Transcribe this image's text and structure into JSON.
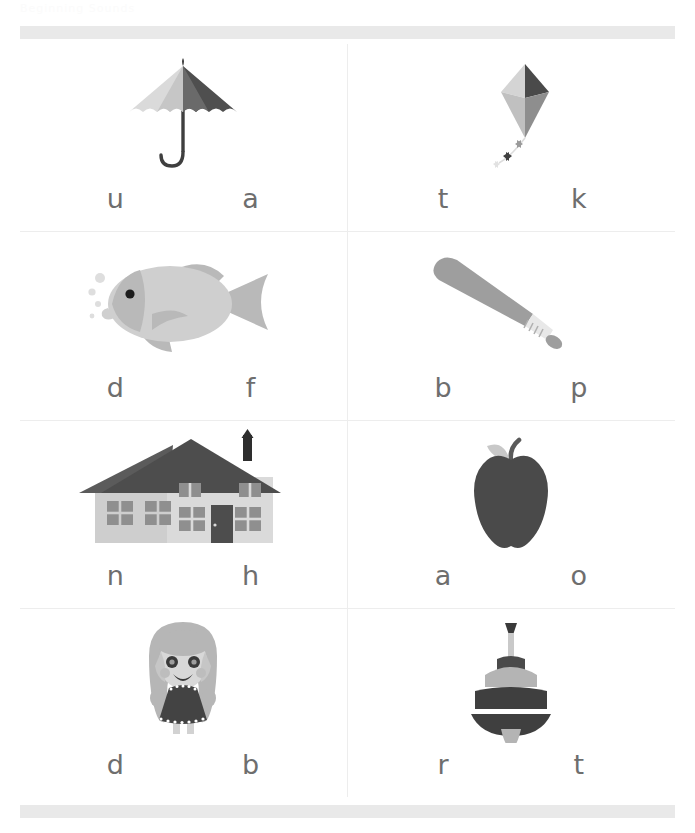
{
  "worksheet": {
    "title": "Beginning Sounds",
    "top_rule": "top-rule-bar",
    "bottom_rule": "bottom-rule-bar"
  },
  "colors": {
    "rule_bar": "#e9e9e9",
    "grid_line": "#ededed",
    "letter": "#6e6e6e",
    "page_bg": "#ffffff",
    "art_light": "#d8d8d8",
    "art_mid": "#b4b4b4",
    "art_dark": "#555555",
    "art_darker": "#3f3f3f"
  },
  "items": [
    {
      "picture": "umbrella",
      "picture_label": "umbrella-illustration",
      "choices": [
        {
          "letter": "u",
          "name": "choice-u"
        },
        {
          "letter": "a",
          "name": "choice-a"
        }
      ]
    },
    {
      "picture": "kite",
      "picture_label": "kite-illustration",
      "choices": [
        {
          "letter": "t",
          "name": "choice-t"
        },
        {
          "letter": "k",
          "name": "choice-k"
        }
      ]
    },
    {
      "picture": "fish",
      "picture_label": "fish-illustration",
      "choices": [
        {
          "letter": "d",
          "name": "choice-d"
        },
        {
          "letter": "f",
          "name": "choice-f"
        }
      ]
    },
    {
      "picture": "baseball-bat",
      "picture_label": "baseball-bat-illustration",
      "choices": [
        {
          "letter": "b",
          "name": "choice-b"
        },
        {
          "letter": "p",
          "name": "choice-p"
        }
      ]
    },
    {
      "picture": "house",
      "picture_label": "house-illustration",
      "choices": [
        {
          "letter": "n",
          "name": "choice-n"
        },
        {
          "letter": "h",
          "name": "choice-h"
        }
      ]
    },
    {
      "picture": "apple",
      "picture_label": "apple-illustration",
      "choices": [
        {
          "letter": "a",
          "name": "choice-a"
        },
        {
          "letter": "o",
          "name": "choice-o"
        }
      ]
    },
    {
      "picture": "doll",
      "picture_label": "doll-illustration",
      "choices": [
        {
          "letter": "d",
          "name": "choice-d"
        },
        {
          "letter": "b",
          "name": "choice-b"
        }
      ]
    },
    {
      "picture": "spinning-top",
      "picture_label": "spinning-top-illustration",
      "choices": [
        {
          "letter": "r",
          "name": "choice-r"
        },
        {
          "letter": "t",
          "name": "choice-t"
        }
      ]
    }
  ]
}
